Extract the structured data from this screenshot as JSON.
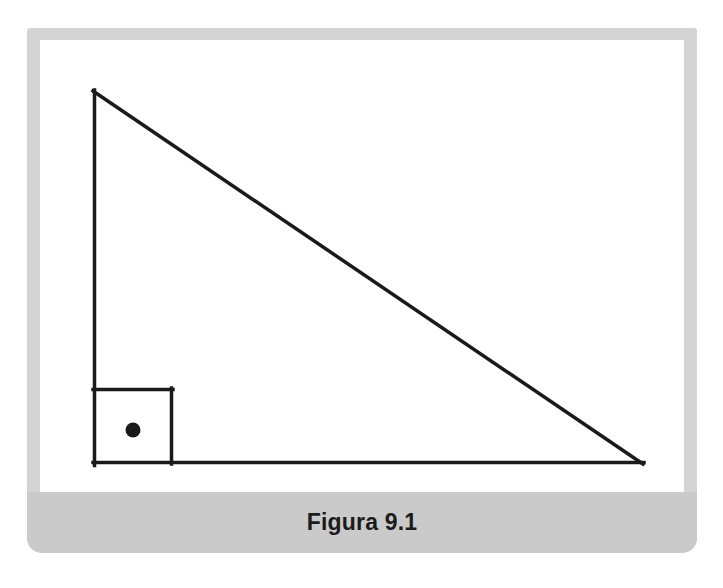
{
  "figure": {
    "caption": "Figura 9.1",
    "frame_color": "#d4d4d4",
    "caption_band_color": "#cacaca",
    "canvas_color": "#ffffff",
    "ink_color": "#1a1a1a"
  },
  "diagram": {
    "type": "right-triangle",
    "stroke_width": 3.5,
    "vertices": {
      "apex": {
        "x": 53,
        "y": 51
      },
      "right_angle": {
        "x": 53,
        "y": 424
      },
      "base_end": {
        "x": 603,
        "y": 424
      }
    },
    "right_angle_marker": {
      "x": 53,
      "y": 348,
      "width": 81,
      "height": 76
    },
    "center_dot": {
      "cx": 93,
      "cy": 390,
      "r": 7.5
    }
  }
}
